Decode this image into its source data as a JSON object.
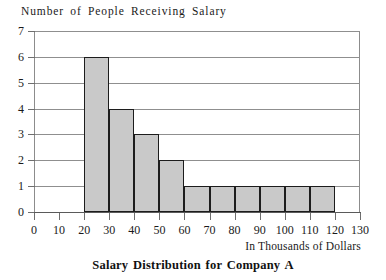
{
  "chart_data": {
    "type": "bar",
    "title": "Salary Distribution for Company A",
    "ylabel": "Number of People Receiving Salary",
    "xlabel": "In Thousands of Dollars",
    "xlim": [
      0,
      130
    ],
    "ylim": [
      0,
      7
    ],
    "grid": true,
    "legend": null,
    "bin_width": 10,
    "x_ticks": [
      0,
      10,
      20,
      30,
      40,
      50,
      60,
      70,
      80,
      90,
      100,
      110,
      120,
      130
    ],
    "x_tick_labels": [
      "0",
      "10",
      "20",
      "30",
      "40",
      "50",
      "60",
      "70",
      "80",
      "90",
      "100",
      "110",
      "120",
      "130"
    ],
    "y_ticks": [
      0,
      1,
      2,
      3,
      4,
      5,
      6,
      7
    ],
    "y_tick_labels": [
      "0",
      "1",
      "2",
      "3",
      "4",
      "5",
      "6",
      "7"
    ],
    "bins": [
      {
        "start": 20,
        "end": 30,
        "value": 6
      },
      {
        "start": 30,
        "end": 40,
        "value": 4
      },
      {
        "start": 40,
        "end": 50,
        "value": 3
      },
      {
        "start": 50,
        "end": 60,
        "value": 2
      },
      {
        "start": 60,
        "end": 70,
        "value": 1
      },
      {
        "start": 70,
        "end": 80,
        "value": 1
      },
      {
        "start": 80,
        "end": 90,
        "value": 1
      },
      {
        "start": 90,
        "end": 100,
        "value": 1
      },
      {
        "start": 100,
        "end": 110,
        "value": 1
      },
      {
        "start": 110,
        "end": 120,
        "value": 1
      }
    ],
    "categories": [
      "20-30",
      "30-40",
      "40-50",
      "50-60",
      "60-70",
      "70-80",
      "80-90",
      "90-100",
      "100-110",
      "110-120"
    ],
    "values": [
      6,
      4,
      3,
      2,
      1,
      1,
      1,
      1,
      1,
      1
    ],
    "colors": {
      "bar_fill": "#c9c9c9",
      "bar_border": "#1c1c1c",
      "gridline": "#8f8f8f",
      "axis": "#5a5a5a",
      "text": "#1a1a1a",
      "background": "#ffffff"
    }
  }
}
